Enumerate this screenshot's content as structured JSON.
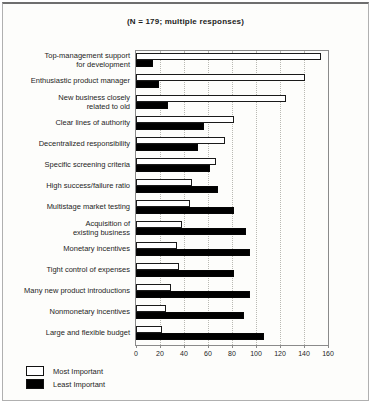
{
  "chart_data": {
    "type": "bar",
    "orientation": "horizontal",
    "title": "(N = 179; multiple responses)",
    "categories": [
      "Top-management support\nfor development",
      "Enthusiastic product manager",
      "New business closely\nrelated to old",
      "Clear lines of authority",
      "Decentralized responsibility",
      "Specific screening criteria",
      "High success/failure ratio",
      "Multistage market testing",
      "Acquisition of\nexisting business",
      "Monetary incentives",
      "Tight control of expenses",
      "Many new product introductions",
      "Nonmonetary incentives",
      "Large and flexible budget"
    ],
    "series": [
      {
        "name": "Most Important",
        "color": "#ffffff",
        "values": [
          154,
          141,
          125,
          82,
          74,
          67,
          47,
          45,
          38,
          34,
          36,
          29,
          25,
          22
        ]
      },
      {
        "name": "Least Important",
        "color": "#000000",
        "values": [
          14,
          19,
          27,
          57,
          52,
          62,
          68,
          82,
          92,
          95,
          82,
          95,
          90,
          107
        ]
      }
    ],
    "xlabel": "",
    "ylabel": "",
    "xlim": [
      0,
      160
    ],
    "x_ticks": [
      0,
      20,
      40,
      60,
      80,
      100,
      120,
      140,
      160
    ],
    "grid": "vertical-dotted",
    "legend_position": "bottom-left"
  }
}
